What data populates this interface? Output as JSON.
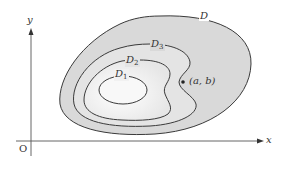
{
  "figure": {
    "axes": {
      "x_label": "x",
      "y_label": "y",
      "origin_label": "O"
    },
    "regions": [
      {
        "name": "D",
        "label_base": "D",
        "label_sub": ""
      },
      {
        "name": "D3",
        "label_base": "D",
        "label_sub": "3"
      },
      {
        "name": "D2",
        "label_base": "D",
        "label_sub": "2"
      },
      {
        "name": "D1",
        "label_base": "D",
        "label_sub": "1"
      }
    ],
    "point": {
      "label": "(a, b)"
    },
    "colors": {
      "outer_fill": "#d8d8d8",
      "inner_fill": "#f4f4f4",
      "stroke": "#3a3a3a",
      "axis": "#555555"
    }
  }
}
